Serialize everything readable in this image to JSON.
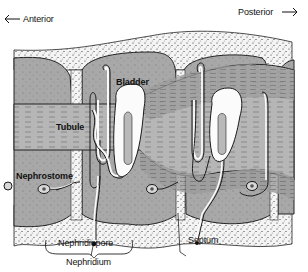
{
  "diagram": {
    "orientation": {
      "anterior_label": "Anterior",
      "anterior_arrow": "←",
      "posterior_label": "Posterior",
      "posterior_arrow": "→"
    },
    "labels": {
      "bladder": "Bladder",
      "tubule": "Tubule",
      "nephrostome": "Nephrostome",
      "nephridiopore": "Nephridiopore",
      "nephridium": "Nephridium",
      "septum": "Septum"
    },
    "colors": {
      "background": "#ffffff",
      "epidermis_stipple": "#f2f2f2",
      "coelom_gray": "#a9a9a9",
      "muscle_gray": "#9a9a9a",
      "intestine_gray": "#b4b4b4",
      "bladder_white": "#fafafa",
      "outline": "#1a1a1a"
    }
  }
}
